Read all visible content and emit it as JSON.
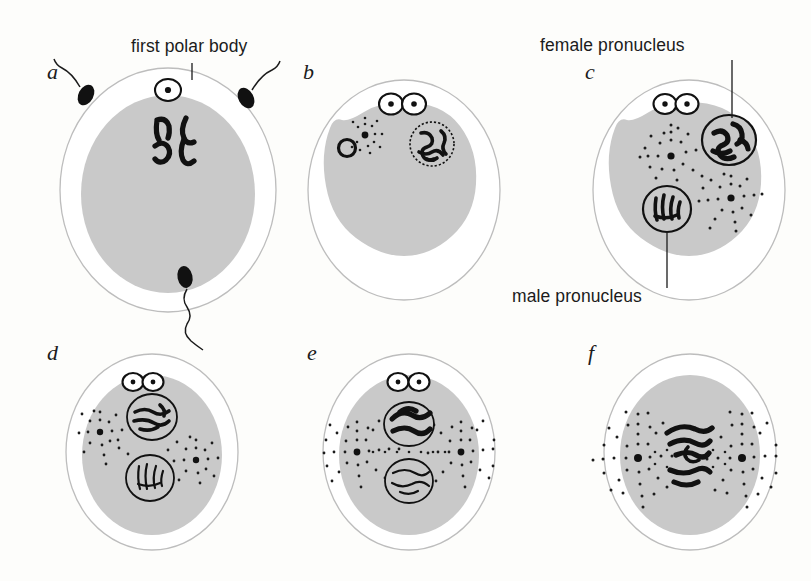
{
  "figure": {
    "title_present": false,
    "background_color": "#fdfdfb",
    "ink_color": "#111111",
    "cytoplasm_color": "#c9c9c9",
    "zona_color": "#ffffff",
    "zona_stroke": "#bdbdbd"
  },
  "annotations": [
    {
      "id": "first-polar-body",
      "text": "first polar body",
      "x": 131,
      "y": 44,
      "target_panel": "a"
    },
    {
      "id": "female-pronucleus",
      "text": "female pronucleus",
      "x": 540,
      "y": 43,
      "target_panel": "c"
    },
    {
      "id": "male-pronucleus",
      "text": "male pronucleus",
      "x": 512,
      "y": 302,
      "target_panel": "c"
    }
  ],
  "panels": [
    {
      "id": "a",
      "letter": "a",
      "letter_x": 47,
      "letter_y": 79,
      "center_x": 168,
      "center_y": 190,
      "zona_rx": 108,
      "zona_ry": 122,
      "cyto_rx": 87,
      "cyto_ry": 99,
      "description": "unfertilized egg with first polar body, four meiotic chromosomes, three sperm outside",
      "sperm_count": 3,
      "polar_bodies": 1,
      "chromosomes": 4,
      "asters": 0,
      "pronuclei": 0
    },
    {
      "id": "b",
      "letter": "b",
      "letter_x": 303,
      "letter_y": 79,
      "center_x": 404,
      "center_y": 190,
      "zona_rx": 96,
      "zona_ry": 110,
      "cyto_rx": 78,
      "cyto_ry": 90,
      "description": "sperm head entered with small aster; female nucleus with dotted envelope; two polar bodies",
      "sperm_count": 0,
      "polar_bodies": 2,
      "chromosomes": 0,
      "asters": 1,
      "pronuclei": 0
    },
    {
      "id": "c",
      "letter": "c",
      "letter_x": 585,
      "letter_y": 79,
      "center_x": 689,
      "center_y": 190,
      "zona_rx": 96,
      "zona_ry": 110,
      "cyto_rx": 78,
      "cyto_ry": 90,
      "description": "male and female pronuclei with two large asters approaching each other",
      "sperm_count": 0,
      "polar_bodies": 2,
      "chromosomes": 0,
      "asters": 2,
      "pronuclei": 2
    },
    {
      "id": "d",
      "letter": "d",
      "letter_x": 47,
      "letter_y": 360,
      "center_x": 152,
      "center_y": 452,
      "zona_rx": 86,
      "zona_ry": 98,
      "cyto_rx": 70,
      "cyto_ry": 80,
      "description": "two pronuclei apposed, paired asters between them",
      "sperm_count": 0,
      "polar_bodies": 2,
      "chromosomes": 0,
      "asters": 2,
      "pronuclei": 2
    },
    {
      "id": "e",
      "letter": "e",
      "letter_x": 307,
      "letter_y": 360,
      "center_x": 409,
      "center_y": 452,
      "zona_rx": 86,
      "zona_ry": 98,
      "cyto_rx": 70,
      "cyto_ry": 80,
      "description": "pronuclei fusing, spindle forming between two asters",
      "sperm_count": 0,
      "polar_bodies": 2,
      "chromosomes": 0,
      "asters": 2,
      "pronuclei": 2
    },
    {
      "id": "f",
      "letter": "f",
      "letter_x": 588,
      "letter_y": 360,
      "center_x": 690,
      "center_y": 452,
      "zona_rx": 86,
      "zona_ry": 98,
      "cyto_rx": 70,
      "cyto_ry": 80,
      "description": "first cleavage metaphase: fused chromatin on spindle between two asters",
      "sperm_count": 0,
      "polar_bodies": 2,
      "chromosomes": 0,
      "asters": 2,
      "pronuclei": 0
    }
  ],
  "structures": {
    "polar_body": "polar-body",
    "sperm": "sperm",
    "aster": "aster",
    "pronucleus": "pronucleus",
    "chromosome": "chromosome",
    "spindle": "spindle",
    "zona_pellucida": "zona-pellucida",
    "cytoplasm": "cytoplasm"
  }
}
